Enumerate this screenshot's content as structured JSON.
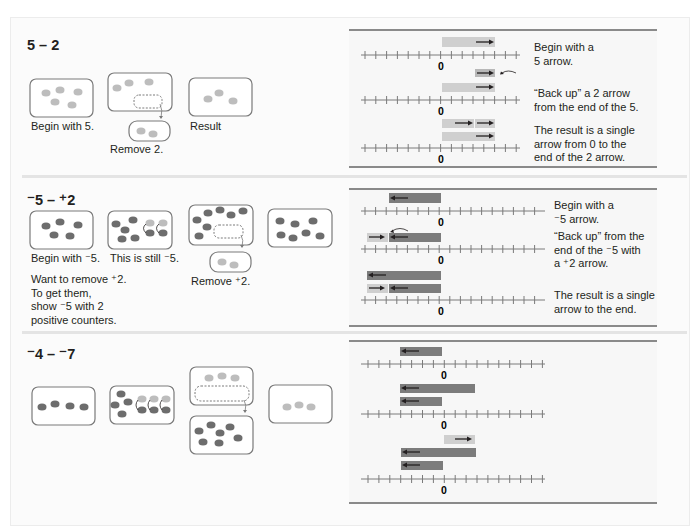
{
  "colors": {
    "positive_counter": "#bdbdbd",
    "negative_counter": "#6d6d6d",
    "positive_arrow_bar": "#cfcfcf",
    "negative_arrow_bar": "#7c7c7c",
    "box_border": "#7a7a7a",
    "panel_rule": "#8a8a8a"
  },
  "sections": [
    {
      "title": "5 – 2",
      "counters": {
        "captions": [
          "Begin with 5.",
          "Remove 2.",
          "Result"
        ]
      },
      "number_line": {
        "zero_label": "0",
        "range": [
          -7,
          7
        ],
        "captions": [
          "Begin with a\n5 arrow.",
          "“Back up” a 2 arrow\nfrom the end of the 5.",
          "The result is a single\narrow from 0 to the\nend of the 2 arrow."
        ]
      }
    },
    {
      "title": "⁻5 – ⁺2",
      "counters": {
        "captions": [
          "Begin with ⁻5.",
          "This is still ⁻5.",
          "Remove ⁺2."
        ],
        "note": "Want to remove ⁺2.\nTo get them,\nshow ⁻5 with 2\npositive counters."
      },
      "number_line": {
        "zero_label": "0",
        "range": [
          -9,
          9
        ],
        "captions": [
          "Begin with a\n⁻5 arrow.",
          "“Back up” from the\nend of the ⁻5 with\na ⁺2 arrow.",
          "The result is a single\narrow to the end."
        ]
      }
    },
    {
      "title": "⁻4 – ⁻7",
      "counters": {
        "captions": []
      },
      "number_line": {
        "zero_label": "0",
        "range": [
          -8,
          9
        ],
        "captions": []
      }
    }
  ]
}
